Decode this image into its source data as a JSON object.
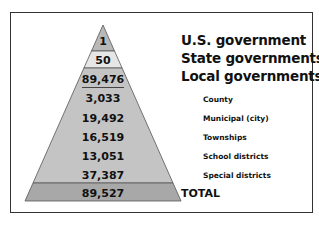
{
  "diagram": {
    "type": "pyramid",
    "levels": [
      {
        "value": "1",
        "label": "U.S. government",
        "level": "major",
        "fill": "#b8b8b8"
      },
      {
        "value": "50",
        "label": "State governments",
        "level": "major",
        "fill": "#e6e6e6"
      },
      {
        "value": "89,476",
        "label": "Local governments",
        "level": "major",
        "fill": "#c4c4c4"
      },
      {
        "value": "3,033",
        "label": "County",
        "level": "sub",
        "fill": "#c4c4c4"
      },
      {
        "value": "19,492",
        "label": "Municipal (city)",
        "level": "sub",
        "fill": "#c4c4c4"
      },
      {
        "value": "16,519",
        "label": "Townships",
        "level": "sub",
        "fill": "#c4c4c4"
      },
      {
        "value": "13,051",
        "label": "School districts",
        "level": "sub",
        "fill": "#c4c4c4"
      },
      {
        "value": "37,387",
        "label": "Special districts",
        "level": "sub",
        "fill": "#c4c4c4"
      },
      {
        "value": "89,527",
        "label": "TOTAL",
        "level": "total",
        "fill": "#a8a8a8"
      }
    ]
  },
  "values": {
    "us": "1",
    "state": "50",
    "local": "89,476",
    "county": "3,033",
    "municipal": "19,492",
    "townships": "16,519",
    "school": "13,051",
    "special": "37,387",
    "total": "89,527"
  },
  "labels": {
    "us": "U.S. government",
    "state": "State governments",
    "local": "Local governments",
    "county": "County",
    "municipal": "Municipal (city)",
    "townships": "Townships",
    "school": "School districts",
    "special": "Special districts",
    "total": "TOTAL"
  },
  "colors": {
    "top": "#b8b8b8",
    "state": "#e6e6e6",
    "body": "#c4c4c4",
    "total": "#a8a8a8",
    "outline": "#555555",
    "frame": "#333333"
  }
}
